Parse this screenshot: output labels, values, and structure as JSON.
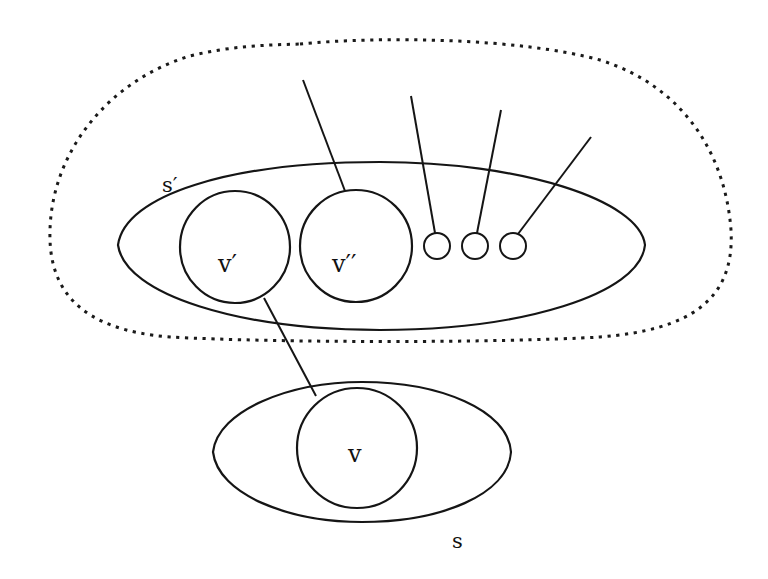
{
  "diagram": {
    "type": "set-graph illustration",
    "background": "#ffffff",
    "stroke_color": "#151515",
    "labels": {
      "s_prime": "s′",
      "s": "s",
      "v_prime": "v′",
      "v_double_prime": "v′′",
      "v": "v"
    },
    "outer_region": {
      "style": "dotted",
      "description": "dotted boundary enclosing s′"
    },
    "sets": [
      {
        "id": "s_prime",
        "label": "s′",
        "shape": "ellipse",
        "cx": 381,
        "cy": 246,
        "rx": 264,
        "ry": 84
      },
      {
        "id": "s",
        "label": "s",
        "shape": "ellipse",
        "cx": 362,
        "cy": 452,
        "rx": 149,
        "ry": 70
      }
    ],
    "nodes": [
      {
        "id": "v_prime",
        "label": "v′",
        "cx": 235,
        "cy": 247,
        "r": 56,
        "in_set": "s_prime"
      },
      {
        "id": "v_double_prime",
        "label": "v′′",
        "cx": 356,
        "cy": 246,
        "r": 56,
        "in_set": "s_prime"
      },
      {
        "id": "small_1",
        "label": "",
        "cx": 437,
        "cy": 246,
        "r": 13,
        "in_set": "s_prime"
      },
      {
        "id": "small_2",
        "label": "",
        "cx": 475,
        "cy": 246,
        "r": 13,
        "in_set": "s_prime"
      },
      {
        "id": "small_3",
        "label": "",
        "cx": 513,
        "cy": 246,
        "r": 13,
        "in_set": "s_prime"
      },
      {
        "id": "v",
        "label": "v",
        "cx": 357,
        "cy": 448,
        "r": 60,
        "in_set": "s"
      }
    ],
    "edges": [
      {
        "from": "v_prime",
        "to": "v"
      },
      {
        "from": "v_double_prime",
        "to": "external"
      },
      {
        "from": "small_1",
        "to": "external"
      },
      {
        "from": "small_2",
        "to": "external"
      },
      {
        "from": "small_3",
        "to": "external"
      }
    ]
  }
}
